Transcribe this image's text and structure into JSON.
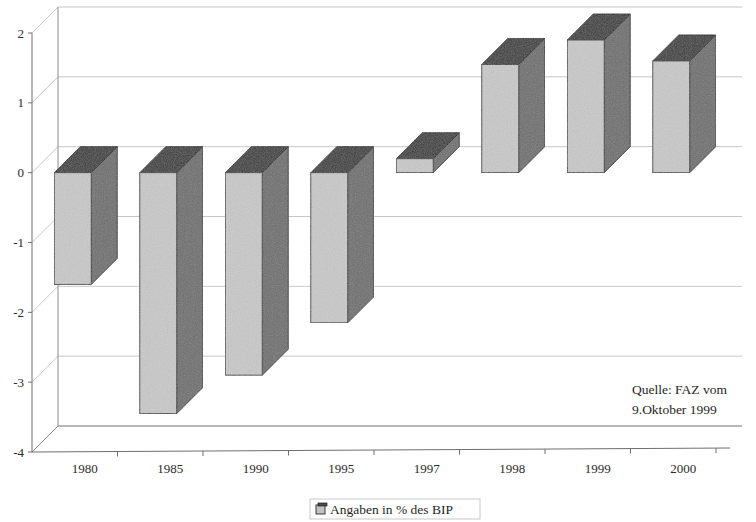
{
  "chart_data": {
    "type": "bar",
    "title": "",
    "subtitle": "",
    "xlabel": "",
    "ylabel": "",
    "categories": [
      "1980",
      "1985",
      "1990",
      "1995",
      "1997",
      "1998",
      "1999",
      "2000"
    ],
    "series": [
      {
        "name": "Angaben in % des BIP",
        "values": [
          -1.6,
          -3.45,
          -2.9,
          -2.15,
          0.2,
          1.55,
          1.9,
          1.6
        ]
      }
    ],
    "ylim": [
      -4,
      2
    ],
    "ytick_labels": [
      "2",
      "1",
      "0",
      "-1",
      "-2",
      "-3",
      "-4"
    ],
    "ytick_values": [
      2,
      1,
      0,
      -1,
      -2,
      -3,
      -4
    ],
    "grid": true,
    "grid_axis": "y",
    "legend_position": "bottom",
    "three_d": true,
    "bar_colors": {
      "front": "#c9c9c9",
      "side": "#6e6e6e",
      "top": "#3a3a3a"
    },
    "grid_color": "#b9b9b9",
    "axis_color": "#8d8d8d",
    "background": "#ffffff"
  },
  "legend": {
    "entries": [
      {
        "label": "Angaben in % des BIP",
        "swatch": "gray-3d-square"
      }
    ]
  },
  "annotations": {
    "source": {
      "line1": "Quelle: FAZ vom",
      "line2": "9.Oktober 1999"
    }
  }
}
